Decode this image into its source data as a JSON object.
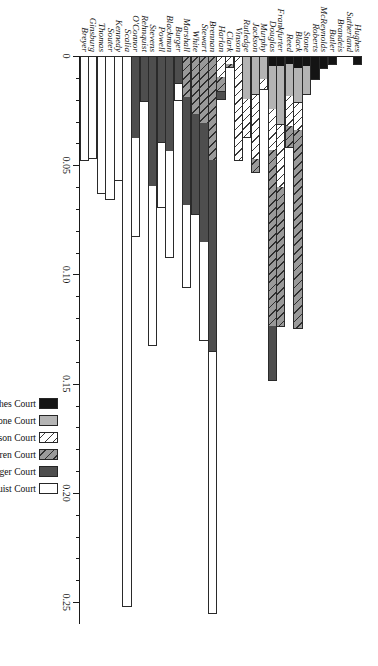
{
  "chart_data": {
    "type": "bar",
    "orientation": "horizontal-stacked",
    "title": "",
    "xlabel": "",
    "ylabel": "",
    "xlim": [
      0,
      0.26
    ],
    "ticks": [
      0,
      0.05,
      0.1,
      0.15,
      0.2,
      0.25
    ],
    "tick_labels": [
      "0",
      "0.05",
      "0.10",
      "0.15",
      "0.20",
      "0.25"
    ],
    "minor_tick_step": 0.01,
    "grid": false,
    "legend_position": "left",
    "series": [
      {
        "name": "Hughes Court",
        "key": "hughes",
        "swatch": "solid-black"
      },
      {
        "name": "Stone Court",
        "key": "stone",
        "swatch": "solid-light-gray"
      },
      {
        "name": "Vinson Court",
        "key": "vinson",
        "swatch": "light-diagonal-hatch"
      },
      {
        "name": "Warren Court",
        "key": "warren",
        "swatch": "dark-diagonal-hatch"
      },
      {
        "name": "Burger Court",
        "key": "burger",
        "swatch": "solid-dark-gray"
      },
      {
        "name": "Rehnquist Court",
        "key": "rehnquist",
        "swatch": "solid-white"
      }
    ],
    "categories": [
      "Hughes",
      "Sutherland",
      "Brandeis",
      "Butler",
      "McReynolds",
      "Roberts",
      "Stone",
      "Black",
      "Reed",
      "Frankfurter",
      "Douglas",
      "Murphy",
      "Jackson",
      "Rutledge",
      "Vinson",
      "Clark",
      "Harlan",
      "Brennan",
      "Stewart",
      "White",
      "Marshall",
      "Burger",
      "Blackmun",
      "Powell",
      "Stevens",
      "Rehnquist",
      "O'Connor",
      "Scalia",
      "Kennedy",
      "Souter",
      "Thomas",
      "Ginsburg",
      "Breyer"
    ],
    "values": [
      {
        "category": "Hughes",
        "hughes": 0.004,
        "stone": 0,
        "vinson": 0,
        "warren": 0,
        "burger": 0,
        "rehnquist": 0
      },
      {
        "category": "Sutherland",
        "hughes": 0,
        "stone": 0,
        "vinson": 0,
        "warren": 0,
        "burger": 0,
        "rehnquist": 0
      },
      {
        "category": "Brandeis",
        "hughes": 0,
        "stone": 0,
        "vinson": 0,
        "warren": 0,
        "burger": 0,
        "rehnquist": 0
      },
      {
        "category": "Butler",
        "hughes": 0.004,
        "stone": 0,
        "vinson": 0,
        "warren": 0,
        "burger": 0,
        "rehnquist": 0
      },
      {
        "category": "McReynolds",
        "hughes": 0.006,
        "stone": 0,
        "vinson": 0,
        "warren": 0,
        "burger": 0,
        "rehnquist": 0
      },
      {
        "category": "Roberts",
        "hughes": 0.011,
        "stone": 0,
        "vinson": 0,
        "warren": 0,
        "burger": 0,
        "rehnquist": 0
      },
      {
        "category": "Stone",
        "hughes": 0.005,
        "stone": 0.013,
        "vinson": 0,
        "warren": 0,
        "burger": 0,
        "rehnquist": 0
      },
      {
        "category": "Black",
        "hughes": 0.006,
        "stone": 0.016,
        "vinson": 0.013,
        "warren": 0.091,
        "burger": 0,
        "rehnquist": 0
      },
      {
        "category": "Reed",
        "hughes": 0.004,
        "stone": 0.015,
        "vinson": 0.014,
        "warren": 0.01,
        "burger": 0,
        "rehnquist": 0
      },
      {
        "category": "Frankfurter",
        "hughes": 0.005,
        "stone": 0.027,
        "vinson": 0.029,
        "warren": 0.064,
        "burger": 0,
        "rehnquist": 0
      },
      {
        "category": "Douglas",
        "hughes": 0.005,
        "stone": 0.02,
        "vinson": 0.019,
        "warren": 0.081,
        "burger": 0.025,
        "rehnquist": 0
      },
      {
        "category": "Murphy",
        "hughes": 0,
        "stone": 0.011,
        "vinson": 0.005,
        "warren": 0,
        "burger": 0,
        "rehnquist": 0
      },
      {
        "category": "Jackson",
        "hughes": 0,
        "stone": 0.018,
        "vinson": 0.03,
        "warren": 0.006,
        "burger": 0,
        "rehnquist": 0
      },
      {
        "category": "Rutledge",
        "hughes": 0,
        "stone": 0.02,
        "vinson": 0.018,
        "warren": 0,
        "burger": 0,
        "rehnquist": 0
      },
      {
        "category": "Vinson",
        "hughes": 0,
        "stone": 0,
        "vinson": 0.048,
        "warren": 0,
        "burger": 0,
        "rehnquist": 0
      },
      {
        "category": "Clark",
        "hughes": 0,
        "stone": 0,
        "vinson": 0.004,
        "warren": 0.002,
        "burger": 0,
        "rehnquist": 0
      },
      {
        "category": "Harlan",
        "hughes": 0,
        "stone": 0,
        "vinson": 0.01,
        "warren": 0.007,
        "burger": 0.004,
        "rehnquist": 0
      },
      {
        "category": "Brennan",
        "hughes": 0,
        "stone": 0,
        "vinson": 0,
        "warren": 0.048,
        "burger": 0.088,
        "rehnquist": 0.12
      },
      {
        "category": "Stewart",
        "hughes": 0,
        "stone": 0,
        "vinson": 0,
        "warren": 0.031,
        "burger": 0.055,
        "rehnquist": 0.045
      },
      {
        "category": "White",
        "hughes": 0,
        "stone": 0,
        "vinson": 0,
        "warren": 0.027,
        "burger": 0.046,
        "rehnquist": 0
      },
      {
        "category": "Marshall",
        "hughes": 0,
        "stone": 0,
        "vinson": 0,
        "warren": 0.019,
        "burger": 0.05,
        "rehnquist": 0.038
      },
      {
        "category": "Burger",
        "hughes": 0,
        "stone": 0,
        "vinson": 0,
        "warren": 0,
        "burger": 0.013,
        "rehnquist": 0.008
      },
      {
        "category": "Blackmun",
        "hughes": 0,
        "stone": 0,
        "vinson": 0,
        "warren": 0,
        "burger": 0.044,
        "rehnquist": 0.049
      },
      {
        "category": "Powell",
        "hughes": 0,
        "stone": 0,
        "vinson": 0,
        "warren": 0,
        "burger": 0.04,
        "rehnquist": 0.03
      },
      {
        "category": "Stevens",
        "hughes": 0,
        "stone": 0,
        "vinson": 0,
        "warren": 0,
        "burger": 0.06,
        "rehnquist": 0.073
      },
      {
        "category": "Rehnquist",
        "hughes": 0,
        "stone": 0,
        "vinson": 0,
        "warren": 0,
        "burger": 0.021,
        "rehnquist": 0
      },
      {
        "category": "O'Connor",
        "hughes": 0,
        "stone": 0,
        "vinson": 0,
        "warren": 0,
        "burger": 0.038,
        "rehnquist": 0.045
      },
      {
        "category": "Scalia",
        "hughes": 0,
        "stone": 0,
        "vinson": 0,
        "warren": 0,
        "burger": 0,
        "rehnquist": 0.252
      },
      {
        "category": "Kennedy",
        "hughes": 0,
        "stone": 0,
        "vinson": 0,
        "warren": 0,
        "burger": 0,
        "rehnquist": 0.057
      },
      {
        "category": "Souter",
        "hughes": 0,
        "stone": 0,
        "vinson": 0,
        "warren": 0,
        "burger": 0,
        "rehnquist": 0.066
      },
      {
        "category": "Thomas",
        "hughes": 0,
        "stone": 0,
        "vinson": 0,
        "warren": 0,
        "burger": 0,
        "rehnquist": 0.063
      },
      {
        "category": "Ginsburg",
        "hughes": 0,
        "stone": 0,
        "vinson": 0,
        "warren": 0,
        "burger": 0,
        "rehnquist": 0.047
      },
      {
        "category": "Breyer",
        "hughes": 0,
        "stone": 0,
        "vinson": 0,
        "warren": 0,
        "burger": 0,
        "rehnquist": 0.048
      }
    ],
    "colors": {
      "hughes": "#141414",
      "stone": "#b4b4b4",
      "vinson": "#ffffff",
      "warren": "#9a9a9a",
      "burger": "#4e4e4e",
      "rehnquist": "#ffffff",
      "axis": "#1a1a1a",
      "background": "#ffffff"
    }
  }
}
